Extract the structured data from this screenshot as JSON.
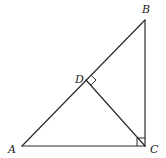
{
  "diagram": {
    "type": "geometry",
    "colors": {
      "stroke": "#2a2a2a",
      "label": "#222222",
      "background": "#ffffff"
    },
    "points": {
      "A": {
        "label": "A",
        "x": 22,
        "y": 146
      },
      "B": {
        "label": "B",
        "x": 145,
        "y": 20
      },
      "C": {
        "label": "C",
        "x": 145,
        "y": 146
      },
      "D": {
        "label": "D",
        "x": 86,
        "y": 80
      }
    },
    "segments": [
      "AB",
      "BC",
      "CA",
      "CD"
    ],
    "right_angles": [
      "C",
      "D"
    ]
  }
}
